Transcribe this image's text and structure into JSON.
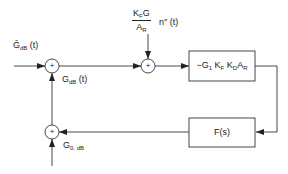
{
  "diagram": {
    "type": "block-diagram",
    "input_label": {
      "base": "Ĝ",
      "sub": "dB",
      "arg": " (t)"
    },
    "output_label": {
      "base": "G",
      "sub": "dB",
      "arg": " (t)"
    },
    "noise_label": {
      "numerator": {
        "k": "K",
        "k_sub": "F",
        "g": "G"
      },
      "denominator": {
        "a": "A",
        "a_sub": "R"
      },
      "factor": "n″ (t)"
    },
    "forward_block": {
      "label": "−G",
      "terms": [
        {
          "base": "−G",
          "sub": "1"
        },
        {
          "base": "K",
          "sub": "F"
        },
        {
          "base": "K",
          "sub": "D"
        },
        {
          "base": "A",
          "sub": "R"
        }
      ]
    },
    "feedback_block": {
      "label": "F(s)"
    },
    "offset_label": {
      "base": "G",
      "sub": "0, dB"
    },
    "summing_junctions": [
      {
        "id": "sum1",
        "sign": "+"
      },
      {
        "id": "sum2",
        "sign": "+"
      },
      {
        "id": "sum3",
        "sign": "+"
      }
    ]
  }
}
